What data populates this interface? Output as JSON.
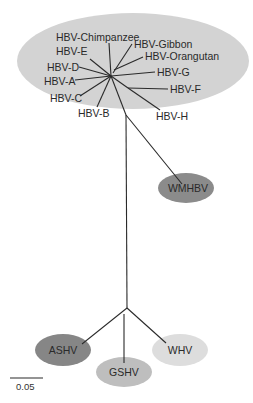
{
  "groups": [
    {
      "name": "primate-hbv-group",
      "color": "#d3d3d3"
    },
    {
      "name": "WMHBV",
      "label": "WMHBV",
      "color": "#8b8b8b"
    },
    {
      "name": "ASHV",
      "label": "ASHV",
      "color": "#868686"
    },
    {
      "name": "GSHV",
      "label": "GSHV",
      "color": "#bebebe"
    },
    {
      "name": "WHV",
      "label": "WHV",
      "color": "#dddddd"
    }
  ],
  "hbv_taxa": [
    {
      "id": "chimpanzee",
      "label": "HBV-Chimpanzee"
    },
    {
      "id": "gibbon",
      "label": "HBV-Gibbon"
    },
    {
      "id": "orangutan",
      "label": "HBV-Orangutan"
    },
    {
      "id": "e",
      "label": "HBV-E"
    },
    {
      "id": "d",
      "label": "HBV-D"
    },
    {
      "id": "a",
      "label": "HBV-A"
    },
    {
      "id": "g",
      "label": "HBV-G"
    },
    {
      "id": "c",
      "label": "HBV-C"
    },
    {
      "id": "f",
      "label": "HBV-F"
    },
    {
      "id": "b",
      "label": "HBV-B"
    },
    {
      "id": "h",
      "label": "HBV-H"
    }
  ],
  "scale_bar": {
    "label": "0.05",
    "value": 0.05
  },
  "line_color": "#2a2a2a"
}
